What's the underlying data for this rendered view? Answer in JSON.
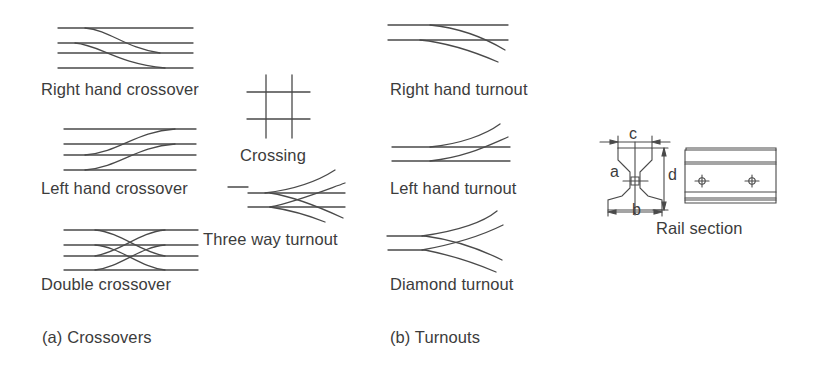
{
  "diagram": {
    "sections": [
      {
        "id": "a",
        "caption": "(a) Crossovers"
      },
      {
        "id": "b",
        "caption": "(b) Turnouts"
      }
    ],
    "crossovers": {
      "right_hand": "Right hand crossover",
      "left_hand": "Left hand crossover",
      "double": "Double crossover",
      "crossing": "Crossing",
      "three_way": "Three way turnout"
    },
    "turnouts": {
      "right_hand": "Right hand turnout",
      "left_hand": "Left hand turnout",
      "diamond": "Diamond turnout"
    },
    "rail_section": {
      "title": "Rail section",
      "dimensions": {
        "a": "a",
        "b": "b",
        "c": "c",
        "d": "d"
      }
    },
    "colors": {
      "line": "#4a4a4a",
      "text": "#3c3c3c",
      "background": "#ffffff"
    }
  }
}
